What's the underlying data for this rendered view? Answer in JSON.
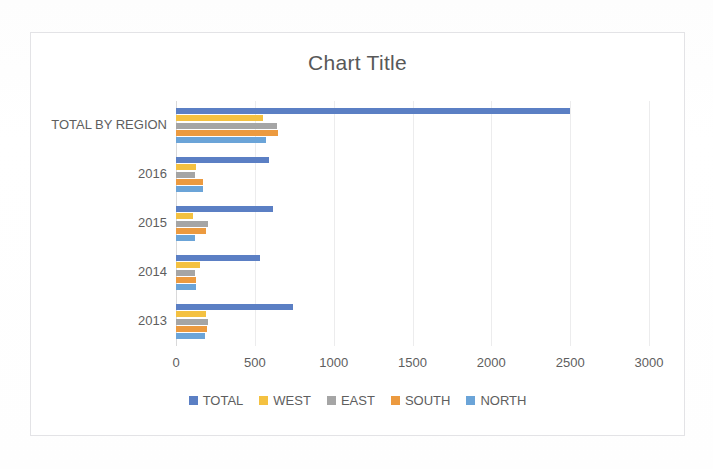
{
  "chart": {
    "title": "Chart Title",
    "frame_border_color": "#e3e3e6",
    "background": "#ffffff"
  },
  "axis": {
    "xticks": [
      "0",
      "500",
      "1000",
      "1500",
      "2000",
      "2500",
      "3000"
    ],
    "xmin": 0,
    "xmax": 3000,
    "xstep": 500
  },
  "legend": {
    "position": "bottom",
    "items": [
      {
        "label": "TOTAL",
        "color": "#5b7fc4"
      },
      {
        "label": "WEST",
        "color": "#f4c141"
      },
      {
        "label": "EAST",
        "color": "#a5a5a5"
      },
      {
        "label": "SOUTH",
        "color": "#ec9a3f"
      },
      {
        "label": "NORTH",
        "color": "#6ba4d8"
      }
    ]
  },
  "chart_data": {
    "type": "bar",
    "orientation": "horizontal",
    "title": "Chart Title",
    "xlabel": "",
    "ylabel": "",
    "xlim": [
      0,
      3000
    ],
    "grid": true,
    "legend_position": "bottom",
    "categories": [
      "TOTAL BY REGION",
      "2016",
      "2015",
      "2014",
      "2013"
    ],
    "series": [
      {
        "name": "TOTAL",
        "color": "#5b7fc4",
        "values": [
          2500,
          590,
          615,
          530,
          740
        ]
      },
      {
        "name": "WEST",
        "color": "#f4c141",
        "values": [
          550,
          130,
          110,
          150,
          190
        ]
      },
      {
        "name": "EAST",
        "color": "#a5a5a5",
        "values": [
          640,
          120,
          200,
          120,
          200
        ]
      },
      {
        "name": "SOUTH",
        "color": "#ec9a3f",
        "values": [
          650,
          170,
          190,
          130,
          195
        ]
      },
      {
        "name": "NORTH",
        "color": "#6ba4d8",
        "values": [
          570,
          170,
          120,
          130,
          185
        ]
      }
    ]
  }
}
